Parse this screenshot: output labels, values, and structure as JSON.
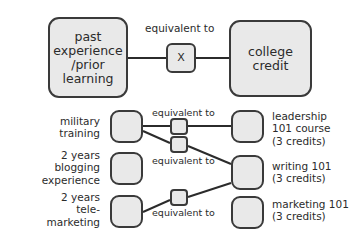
{
  "diagram": {
    "title_row": {
      "source_box": "past\nexperience\n/prior\nlearning",
      "connector_box": "X",
      "target_box": "college\ncredit",
      "connector_caption": "equivalent to"
    },
    "rows": [
      {
        "left_label": "military\ntraining",
        "connector_caption": "equivalent to",
        "right_label": "leadership\n101 course\n(3 credits)"
      },
      {
        "left_label": "2 years\nblogging\nexperience",
        "connector_caption": "equivalent to",
        "right_label": "writing 101\n(3 credits)"
      },
      {
        "left_label": "2 years\ntele-\nmarketing",
        "connector_caption": "equivalent to",
        "right_label": "marketing 101\n(3 credits)"
      }
    ],
    "colors": {
      "box_fill": "#e9e9e9",
      "box_border": "#3a3a3a",
      "wire": "#2b2b2b",
      "text": "#2b2b2b",
      "background": "#ffffff"
    }
  }
}
